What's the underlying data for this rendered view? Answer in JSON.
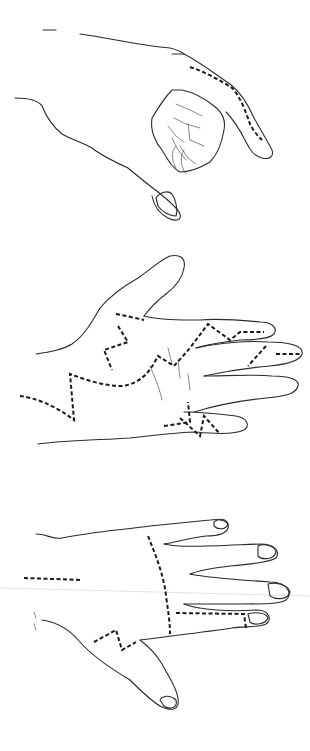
{
  "illustration": {
    "type": "surgical incision line drawings of the hand",
    "colors": {
      "background": "#ffffff",
      "line": "#2a2a2a",
      "incision": "#1a1a1a"
    },
    "panels": [
      {
        "id": "top",
        "view": "lateral view, hand in pinch posture",
        "incisions": [
          "dorsoradial index finger dashed line"
        ]
      },
      {
        "id": "middle",
        "view": "palmar view, open hand",
        "incisions": [
          "thenar zigzag",
          "palmar curved zigzag",
          "index finger zigzag",
          "middle finger oblique",
          "ring/small web dashed",
          "small finger zigzag",
          "forearm curved"
        ]
      },
      {
        "id": "bottom",
        "view": "dorsal view, hand",
        "incisions": [
          "forearm straight dashed",
          "dorsal curved longitudinal",
          "small finger ulnar L-shape",
          "thumb-base zigzag"
        ]
      }
    ]
  }
}
